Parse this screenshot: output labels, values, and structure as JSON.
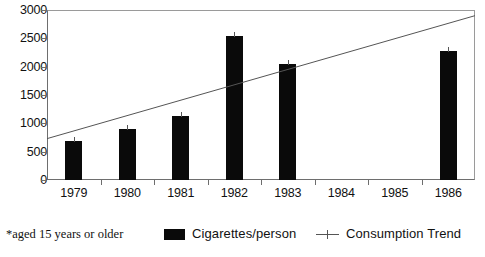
{
  "chart_data": {
    "type": "bar",
    "title": "",
    "xlabel": "",
    "ylabel": "",
    "categories": [
      "1979",
      "1980",
      "1981",
      "1982",
      "1983",
      "1984",
      "1985",
      "1986"
    ],
    "series": [
      {
        "name": "Cigarettes/person",
        "type": "bar",
        "color": "#0a0a0a",
        "values": [
          690,
          900,
          1130,
          2540,
          2050,
          null,
          null,
          2270
        ]
      },
      {
        "name": "Consumption Trend",
        "type": "line",
        "color": "#555555",
        "endpoints": [
          730,
          2900
        ]
      }
    ],
    "ylim": [
      0,
      3000
    ],
    "yticks": [
      0,
      500,
      1000,
      1500,
      2000,
      2500,
      3000
    ],
    "ytick_labels": [
      "0",
      "500",
      "1000",
      "1500",
      "2000",
      "2500",
      "3000"
    ],
    "grid": false,
    "legend_position": "bottom"
  },
  "axes": {
    "y": {
      "ticks": [
        {
          "label": "3000",
          "value": 3000
        },
        {
          "label": "2500",
          "value": 2500
        },
        {
          "label": "2000",
          "value": 2000
        },
        {
          "label": "1500",
          "value": 1500
        },
        {
          "label": "1000",
          "value": 1000
        },
        {
          "label": "500",
          "value": 500
        },
        {
          "label": "0",
          "value": 0
        }
      ]
    },
    "x": {
      "ticks": [
        {
          "label": "1979"
        },
        {
          "label": "1980"
        },
        {
          "label": "1981"
        },
        {
          "label": "1982"
        },
        {
          "label": "1983"
        },
        {
          "label": "1984"
        },
        {
          "label": "1985"
        },
        {
          "label": "1986"
        }
      ]
    }
  },
  "footer": {
    "footnote": "*aged 15 years or older",
    "legend": [
      {
        "label": "Cigarettes/person",
        "marker": "filled-square",
        "color": "#0a0a0a"
      },
      {
        "label": "Consumption Trend",
        "marker": "line-with-tick",
        "color": "#555555"
      }
    ]
  }
}
